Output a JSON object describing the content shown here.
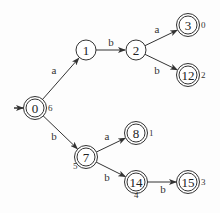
{
  "diagram": {
    "type": "finite-automaton",
    "start_state": "0",
    "colors": {
      "stroke": "#333333",
      "text": "#222222",
      "background": "#fdfdfd"
    },
    "nodes": [
      {
        "id": "0",
        "label": "0",
        "x": 35,
        "y": 108,
        "r": 9,
        "accepting": true,
        "annotation": "6",
        "ann_dx": 13,
        "ann_dy": 3
      },
      {
        "id": "1",
        "label": "1",
        "x": 86,
        "y": 50,
        "r": 10,
        "accepting": false,
        "annotation": "",
        "ann_dx": 0,
        "ann_dy": 0
      },
      {
        "id": "2",
        "label": "2",
        "x": 136,
        "y": 50,
        "r": 10,
        "accepting": false,
        "annotation": "",
        "ann_dx": 0,
        "ann_dy": 0
      },
      {
        "id": "3",
        "label": "3",
        "x": 188,
        "y": 25,
        "r": 9,
        "accepting": true,
        "annotation": "0",
        "ann_dx": 13,
        "ann_dy": 3
      },
      {
        "id": "12",
        "label": "12",
        "x": 188,
        "y": 75,
        "r": 9,
        "accepting": true,
        "annotation": "2",
        "ann_dx": 13,
        "ann_dy": 3
      },
      {
        "id": "7",
        "label": "7",
        "x": 86,
        "y": 157,
        "r": 9,
        "accepting": true,
        "annotation": "5",
        "ann_dx": -13,
        "ann_dy": 12
      },
      {
        "id": "8",
        "label": "8",
        "x": 136,
        "y": 133,
        "r": 9,
        "accepting": true,
        "annotation": "1",
        "ann_dx": 13,
        "ann_dy": 3
      },
      {
        "id": "14",
        "label": "14",
        "x": 136,
        "y": 182,
        "r": 9,
        "accepting": true,
        "annotation": "4",
        "ann_dx": -2,
        "ann_dy": 16
      },
      {
        "id": "15",
        "label": "15",
        "x": 188,
        "y": 182,
        "r": 9,
        "accepting": true,
        "annotation": "3",
        "ann_dx": 13,
        "ann_dy": 3
      }
    ],
    "edges": [
      {
        "from": "0",
        "to": "1",
        "label": "a",
        "lx": 54,
        "ly": 74
      },
      {
        "from": "1",
        "to": "2",
        "label": "b",
        "lx": 111,
        "ly": 46
      },
      {
        "from": "2",
        "to": "3",
        "label": "a",
        "lx": 157,
        "ly": 33
      },
      {
        "from": "2",
        "to": "12",
        "label": "b",
        "lx": 157,
        "ly": 74
      },
      {
        "from": "0",
        "to": "7",
        "label": "b",
        "lx": 54,
        "ly": 140
      },
      {
        "from": "7",
        "to": "8",
        "label": "a",
        "lx": 107,
        "ly": 140
      },
      {
        "from": "7",
        "to": "14",
        "label": "b",
        "lx": 107,
        "ly": 181
      },
      {
        "from": "14",
        "to": "15",
        "label": "b",
        "lx": 163,
        "ly": 193
      }
    ]
  }
}
